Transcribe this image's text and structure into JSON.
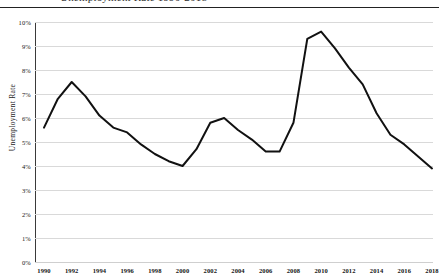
{
  "figure": {
    "cropped_title_fragment": "Unemployment Rate 1990-2018",
    "y_axis_title": "Unemployment Rate"
  },
  "chart_data": {
    "type": "line",
    "title": "",
    "xlabel": "",
    "ylabel": "Unemployment Rate",
    "grid": true,
    "legend": false,
    "xlim": [
      1990,
      2018
    ],
    "ylim": [
      0,
      10
    ],
    "y_tick_labels": [
      "10%",
      "9%",
      "8%",
      "7%",
      "6%",
      "5%",
      "4%",
      "3%",
      "2%",
      "1%",
      "0%"
    ],
    "y_tick_values": [
      10,
      9,
      8,
      7,
      6,
      5,
      4,
      3,
      2,
      1,
      0
    ],
    "x_tick_labels": [
      "1990",
      "1992",
      "1994",
      "1996",
      "1998",
      "2000",
      "2002",
      "2004",
      "2006",
      "2008",
      "2010",
      "2012",
      "2014",
      "2016",
      "2018"
    ],
    "x_tick_values": [
      1990,
      1992,
      1994,
      1996,
      1998,
      2000,
      2002,
      2004,
      2006,
      2008,
      2010,
      2012,
      2014,
      2016,
      2018
    ],
    "series": [
      {
        "name": "Unemployment Rate",
        "color": "#111111",
        "x": [
          1990,
          1991,
          1992,
          1993,
          1994,
          1995,
          1996,
          1997,
          1998,
          1999,
          2000,
          2001,
          2002,
          2003,
          2004,
          2005,
          2006,
          2007,
          2008,
          2009,
          2010,
          2011,
          2012,
          2013,
          2014,
          2015,
          2016,
          2017,
          2018
        ],
        "values": [
          5.6,
          6.8,
          7.5,
          6.9,
          6.1,
          5.6,
          5.4,
          4.9,
          4.5,
          4.2,
          4.0,
          4.7,
          5.8,
          6.0,
          5.5,
          5.1,
          4.6,
          4.6,
          5.8,
          9.3,
          9.6,
          8.9,
          8.1,
          7.4,
          6.2,
          5.3,
          4.9,
          4.4,
          3.9
        ]
      }
    ]
  }
}
